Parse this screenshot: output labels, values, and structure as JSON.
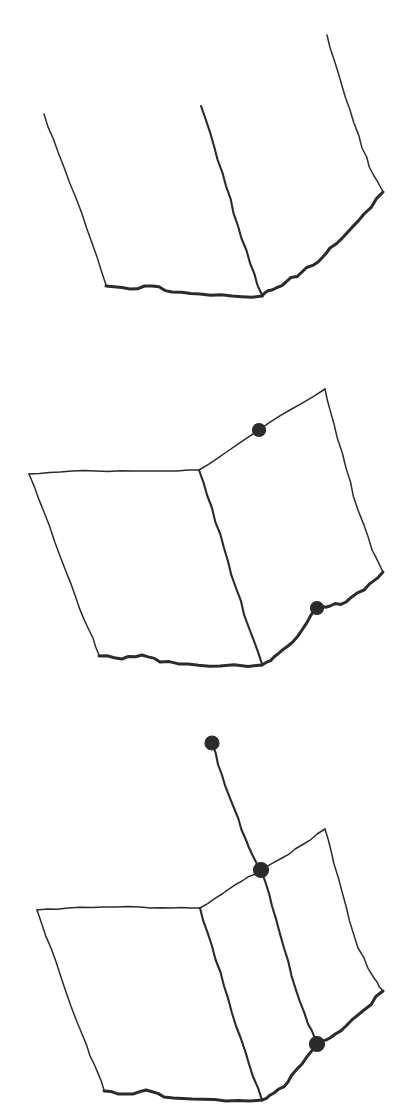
{
  "figure": {
    "medium": "pen-on-paper line drawing",
    "background_color": "#ffffff",
    "ink_color": "#2b2b2b",
    "dot_color": "#2b2b2b",
    "panel_count": 3,
    "width": 404,
    "height": 1106
  },
  "panels": [
    {
      "id": "panel-1",
      "label": "Panel 1",
      "caption": "Outline only: open V-shaped spread with no marked points",
      "dot_count": 0,
      "description": "Two page edges rising from a shared bottom vertex plus a left page outline",
      "strokes": [
        {
          "name": "left-page-outer-edge",
          "weight": "thin",
          "points": "44,114 58,152 76,198 92,243 106,285"
        },
        {
          "name": "left-page-bottom-edge",
          "weight": "heavy",
          "points": "106,286 130,289 152,286 172,292 200,294 232,296 262,296"
        },
        {
          "name": "spine-edge",
          "weight": "med",
          "points": "201,106 214,146 226,186 238,226 250,263 262,295"
        },
        {
          "name": "right-page-outer-edge",
          "weight": "thin",
          "points": "327,35 338,72 350,110 362,148 374,176 383,192"
        },
        {
          "name": "right-page-bottom-edge",
          "weight": "heavy",
          "points": "383,192 364,214 346,234 330,248 318,262 302,272 286,282 272,290 262,296"
        }
      ]
    },
    {
      "id": "panel-2",
      "label": "Panel 2",
      "caption": "Closed outline with two marked points on the right page",
      "dot_count": 2,
      "description": "Full quadrilateral spread with top edges added; dots mark the top edge and bottom edge of the right page",
      "strokes": [
        {
          "name": "left-page-top-edge",
          "weight": "thin",
          "points": "29,474 60,472 96,471 132,471 166,471 199,470"
        },
        {
          "name": "left-page-outer-edge",
          "weight": "thin",
          "points": "29,474 44,512 60,556 76,598 89,630 99,655"
        },
        {
          "name": "left-page-bottom-edge",
          "weight": "heavy",
          "points": "99,656 122,659 142,655 160,662 188,664 220,666 262,665"
        },
        {
          "name": "spine-edge",
          "weight": "med",
          "points": "199,470 212,508 224,548 236,588 249,628 262,664"
        },
        {
          "name": "right-page-top-edge",
          "weight": "thin",
          "points": "199,470 228,451 259,430 290,410 325,389"
        },
        {
          "name": "right-page-outer-edge",
          "weight": "thin",
          "points": "325,389 334,424 346,468 358,510 372,550 383,572"
        },
        {
          "name": "right-page-bottom-edge",
          "weight": "heavy",
          "points": "383,572 364,590 346,602 330,606 317,608 302,630 288,646 274,657 262,665"
        }
      ],
      "dots": [
        {
          "name": "dot-top-edge",
          "x": 259,
          "y": 430,
          "r": 6.5
        },
        {
          "name": "dot-bottom-edge",
          "x": 317,
          "y": 608,
          "r": 6.5
        }
      ]
    },
    {
      "id": "panel-3",
      "label": "Panel 3",
      "caption": "Spread with a turning page: three marked points and an added free corner",
      "dot_count": 3,
      "description": "A third page leaf lifts away from the spine; a free dot floats above, connected by a line to the junction dot at the spine corner",
      "strokes": [
        {
          "name": "left-page-top-edge",
          "weight": "thin",
          "points": "37,910 68,908 104,907 140,907 172,908 200,908"
        },
        {
          "name": "left-page-outer-edge",
          "weight": "thin",
          "points": "37,910 51,948 66,992 82,1034 95,1066 104,1090"
        },
        {
          "name": "left-page-bottom-edge",
          "weight": "heavy",
          "points": "104,1091 126,1094 146,1090 164,1097 192,1099 226,1101 262,1100"
        },
        {
          "name": "spine-edge",
          "weight": "med",
          "points": "200,908 212,946 224,986 236,1026 249,1064 262,1100"
        },
        {
          "name": "middle-page-top-edge",
          "weight": "thin",
          "points": "200,908 222,894 242,881 261,870"
        },
        {
          "name": "turning-page-leading-edge",
          "weight": "med",
          "points": "261,870 272,906 284,948 296,990 308,1024 317,1044"
        },
        {
          "name": "outer-page-top-edge",
          "weight": "thin",
          "points": "261,870 282,858 302,845 325,829"
        },
        {
          "name": "outer-page-outer-edge",
          "weight": "thin",
          "points": "325,829 334,864 346,906 358,948 374,978 383,991"
        },
        {
          "name": "outer-page-bottom-edge",
          "weight": "heavy",
          "points": "383,991 364,1010 346,1026 330,1038 317,1044 302,1064 288,1082 274,1093 262,1100"
        },
        {
          "name": "free-corner-connector",
          "weight": "med",
          "points": "212,743 222,775 234,808 246,840 256,862 261,870"
        }
      ],
      "dots": [
        {
          "name": "dot-free-corner",
          "x": 212,
          "y": 743,
          "r": 7.0
        },
        {
          "name": "dot-spine-junction",
          "x": 261,
          "y": 870,
          "r": 7.5
        },
        {
          "name": "dot-bottom-edge",
          "x": 317,
          "y": 1044,
          "r": 7.5
        }
      ]
    }
  ]
}
